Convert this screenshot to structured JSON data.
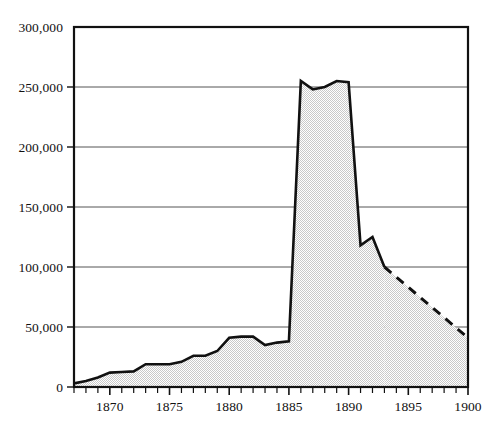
{
  "chart_data": {
    "type": "area",
    "title": "",
    "subtitle": "",
    "xlabel": "",
    "ylabel": "",
    "xlim": [
      1867,
      1900
    ],
    "ylim": [
      0,
      300000
    ],
    "grid": true,
    "legend": null,
    "y_ticks": [
      0,
      50000,
      100000,
      150000,
      200000,
      250000,
      300000
    ],
    "y_tick_labels": [
      "0",
      "50,000",
      "100,000",
      "150,000",
      "200,000",
      "250,000",
      "300,000"
    ],
    "x_ticks": [
      1870,
      1875,
      1880,
      1885,
      1890,
      1895,
      1900
    ],
    "x_tick_labels": [
      "1870",
      "1875",
      "1880",
      "1885",
      "1890",
      "1895",
      "1900"
    ],
    "x_minor_tick_interval": 1,
    "series": [
      {
        "name": "solid-observed",
        "style": "solid",
        "filled": true,
        "x": [
          1867,
          1868,
          1869,
          1870,
          1871,
          1872,
          1873,
          1874,
          1875,
          1876,
          1877,
          1878,
          1879,
          1880,
          1881,
          1882,
          1883,
          1884,
          1885,
          1886,
          1887,
          1888,
          1889,
          1890,
          1891,
          1892,
          1893
        ],
        "values": [
          3000,
          5000,
          8000,
          12000,
          12500,
          13000,
          19000,
          19000,
          19000,
          21000,
          26000,
          26000,
          30000,
          41000,
          42000,
          42000,
          35000,
          37000,
          38000,
          255000,
          248000,
          250000,
          255000,
          254000,
          118000,
          125000,
          100000
        ]
      },
      {
        "name": "dashed-projected",
        "style": "dashed",
        "filled": true,
        "x": [
          1893,
          1900
        ],
        "values": [
          100000,
          41000
        ]
      }
    ],
    "colors": {
      "line": "#111111",
      "fill": "#e6e6e6",
      "grid": "#555555",
      "frame": "#111111",
      "background": "#ffffff",
      "text": "#111111"
    }
  }
}
